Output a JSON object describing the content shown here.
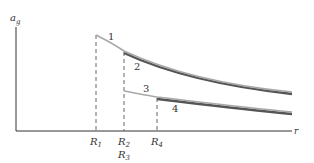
{
  "diagram": {
    "type": "gravitational acceleration vs radius",
    "y_axis_label": "a",
    "y_axis_subscript": "g",
    "x_axis_label": "r",
    "curves": [
      {
        "label": "1",
        "start_marker": "R1"
      },
      {
        "label": "2",
        "start_marker": "R2"
      },
      {
        "label": "3",
        "start_marker": "R3"
      },
      {
        "label": "4",
        "start_marker": "R4"
      }
    ],
    "markers": [
      {
        "name": "R",
        "sub": "1"
      },
      {
        "name": "R",
        "sub": "2"
      },
      {
        "name": "R",
        "sub": "3"
      },
      {
        "name": "R",
        "sub": "4"
      }
    ],
    "colors": {
      "axis": "#333333",
      "light_curve": "#a8a8a8",
      "dark_curve": "#555555",
      "dashed": "#666666"
    }
  }
}
